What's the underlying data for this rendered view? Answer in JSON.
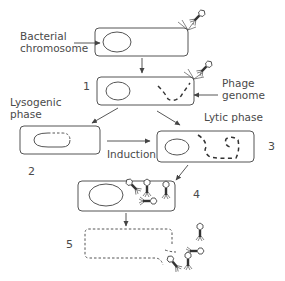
{
  "diagram": {
    "labels": {
      "bacterial_chromosome_line1": "Bacterial",
      "bacterial_chromosome_line2": "chromosome",
      "phage_genome_line1": "Phage",
      "phage_genome_line2": "genome",
      "lysogenic_line1": "Lysogenic",
      "lysogenic_line2": "phase",
      "lytic": "Lytic phase",
      "induction": "Induction"
    },
    "steps": [
      {
        "id": "1",
        "label": "1",
        "description": "Phage injects genome into bacterium"
      },
      {
        "id": "2",
        "label": "2",
        "description": "Prophage integrated into bacterial chromosome"
      },
      {
        "id": "3",
        "label": "3",
        "description": "Phage genome replicates"
      },
      {
        "id": "4",
        "label": "4",
        "description": "New phages assemble"
      },
      {
        "id": "5",
        "label": "5",
        "description": "Cell lyses, releasing phages"
      }
    ],
    "colors": {
      "stroke": "#555555",
      "text": "#4a4a4a",
      "phage": "#333333"
    }
  }
}
